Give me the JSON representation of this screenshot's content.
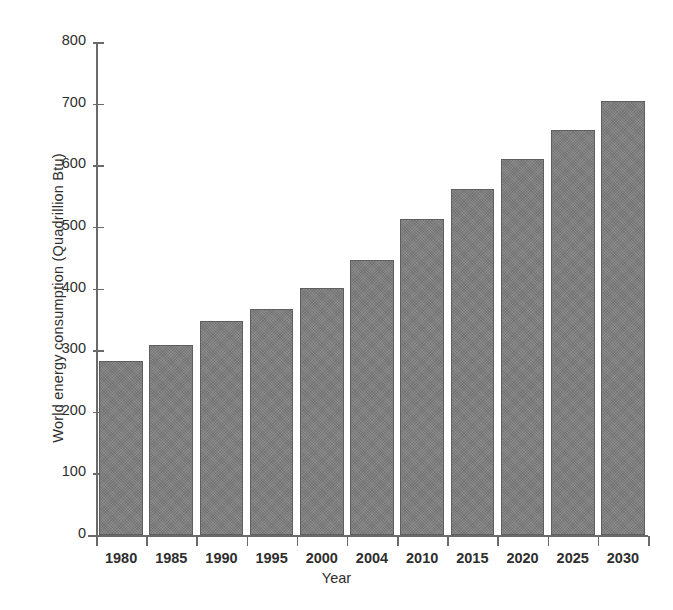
{
  "chart_data": {
    "type": "bar",
    "title": "",
    "xlabel": "Year",
    "ylabel": "World energy consumption (Quadrillion Btu)",
    "categories": [
      "1980",
      "1985",
      "1990",
      "1995",
      "2000",
      "2004",
      "2010",
      "2015",
      "2020",
      "2025",
      "2030"
    ],
    "values": [
      283,
      309,
      348,
      367,
      401,
      447,
      512,
      562,
      610,
      657,
      705
    ],
    "series": [
      {
        "name": "World energy consumption",
        "values": [
          283,
          309,
          348,
          367,
          401,
          447,
          512,
          562,
          610,
          657,
          705
        ]
      }
    ],
    "ylim": [
      0,
      800
    ],
    "yticks": [
      0,
      100,
      200,
      300,
      400,
      500,
      600,
      700,
      800
    ],
    "ytick_labels": [
      "0",
      "100",
      "200",
      "300",
      "400",
      "500",
      "600",
      "700",
      "800"
    ],
    "grid": false,
    "legend": false,
    "legend_position": "none",
    "bar_color": "#7d7d7d",
    "bar_edge_color": "#5f5f5f",
    "axis_color": "#6a6a6a",
    "background_color": "#ffffff",
    "text_color": "#2e2e2e"
  }
}
